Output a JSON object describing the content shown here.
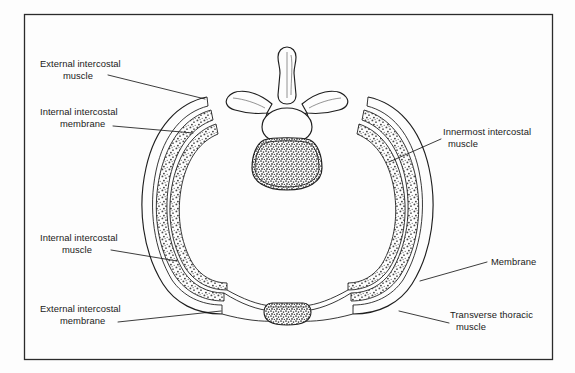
{
  "figure": {
    "background_color": "#fdfdfd",
    "border_color": "#2b2b2b",
    "ink_color": "#1a1a1a"
  },
  "labels": [
    {
      "id": "external-intercostal-muscle",
      "lines": [
        "External intercostal",
        "muscle"
      ],
      "position": "upper-left",
      "text_x": 40,
      "text_y": 67,
      "line2_x": 63,
      "leader": "M 108 75 L 205 99"
    },
    {
      "id": "internal-intercostal-membrane",
      "lines": [
        "Internal intercostal",
        "membrane"
      ],
      "position": "left",
      "text_x": 40,
      "text_y": 115,
      "line2_x": 60,
      "leader": "M 113 126 L 193 133"
    },
    {
      "id": "internal-intercostal-muscle",
      "lines": [
        "Internal intercostal",
        "muscle"
      ],
      "position": "lower-left",
      "text_x": 40,
      "text_y": 241,
      "line2_x": 62,
      "leader": "M 111 250 L 175 260"
    },
    {
      "id": "external-intercostal-membrane",
      "lines": [
        "External intercostal",
        "membrane"
      ],
      "position": "bottom-left",
      "text_x": 40,
      "text_y": 312,
      "line2_x": 60,
      "leader": "M 118 322 L 219 311"
    },
    {
      "id": "innermost-intercostal-muscle",
      "lines": [
        "Innermost intercostal",
        "muscle"
      ],
      "position": "right",
      "text_x": 443,
      "text_y": 135,
      "line2_x": 448,
      "leader": "M 441 139 L 389 162"
    },
    {
      "id": "membrane",
      "lines": [
        "Membrane"
      ],
      "position": "right-middle",
      "text_x": 491,
      "text_y": 265,
      "line2_x": 491,
      "leader": "M 487 262 L 420 280"
    },
    {
      "id": "transverse-thoracic-muscle",
      "lines": [
        "Transverse thoracic",
        "muscle"
      ],
      "position": "bottom-right",
      "text_x": 450,
      "text_y": 318,
      "line2_x": 456,
      "leader": "M 449 323 L 400 310"
    }
  ],
  "anatomy": {
    "vertebra": {
      "name": "thoracic-vertebra",
      "parts": [
        "spinous-process",
        "transverse-process-left",
        "transverse-process-right",
        "vertebral-foramen",
        "vertebral-body"
      ]
    },
    "sternum": {
      "name": "sternum",
      "fill": "stippled-dense"
    },
    "rib_layers": [
      {
        "name": "external-intercostal-layer",
        "fill": "stippled"
      },
      {
        "name": "internal-intercostal-layer",
        "fill": "stippled"
      },
      {
        "name": "innermost-intercostal-layer",
        "fill": "stippled"
      }
    ]
  }
}
